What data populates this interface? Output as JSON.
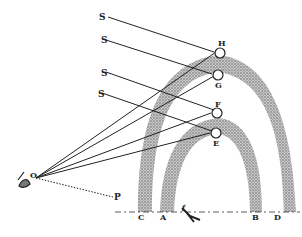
{
  "diagram": {
    "type": "rainbow-geometry",
    "labels": {
      "S1": "S",
      "S2": "S",
      "S3": "S",
      "S4": "S",
      "H": "H",
      "G": "G",
      "F": "F",
      "E": "E",
      "O": "O",
      "P": "P",
      "C": "C",
      "A": "A",
      "f": "f",
      "B": "B",
      "D": "D"
    },
    "colors": {
      "ink": "#222222",
      "arc": "#9a9a9a",
      "background": "#ffffff"
    }
  }
}
